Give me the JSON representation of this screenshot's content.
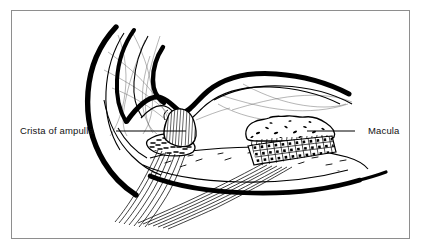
{
  "figure": {
    "background_color": "#ffffff",
    "ink_color": "#000000",
    "frame": {
      "name": "figure-border",
      "color": "#8e8e8e",
      "x": 11,
      "y": 10,
      "width": 399,
      "height": 229
    }
  },
  "labels": [
    {
      "id": "crista",
      "text": "Crista of ampulla",
      "side": "left",
      "text_x": 20,
      "text_y": 134,
      "leader": {
        "x1": 116,
        "y1": 131,
        "x2": 186,
        "y2": 131
      }
    },
    {
      "id": "macula",
      "text": "Macula",
      "side": "right",
      "text_x": 368,
      "text_y": 134,
      "leader": {
        "x1": 355,
        "y1": 131,
        "x2": 307,
        "y2": 131
      }
    }
  ],
  "structures": {
    "outer_wall": "thick-black-bony-labyrinth-wall",
    "inner_duct": "thin-membranous-duct-outline",
    "crista": "sensory-ridge-with-cupula-striations",
    "macula": "otolithic-membrane-over-cuboidal-cell-grid",
    "nerve_bundles": "vestibular-nerve-fiber-bundles",
    "stroma": "stippled-connective-tissue",
    "filaments": "fine-hairline-strands"
  },
  "colors": {
    "ink": "#000000",
    "frame": "#8e8e8e",
    "hairline": "#555555",
    "paper": "#ffffff"
  }
}
